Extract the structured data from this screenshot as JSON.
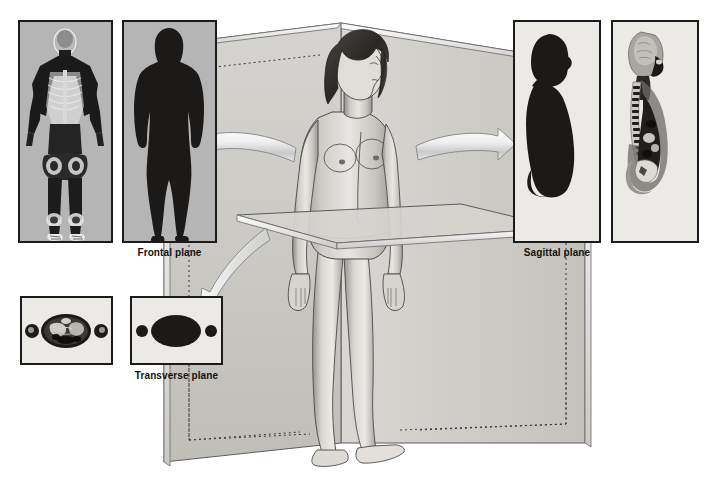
{
  "figure": {
    "background_color": "#ffffff",
    "panel_fill_left": "#b5b5b5",
    "panel_fill_right": "#eceae7",
    "panel_border_color": "#1b1b1b",
    "arrow_fill": "#e9e9e9",
    "arrow_stroke": "#8d8d8d",
    "plane_fill": "#cfcdc9",
    "plane_stroke": "#5a5a5a"
  },
  "labels": {
    "frontal": "Frontal plane",
    "sagittal": "Sagittal plane",
    "transverse": "Transverse plane"
  },
  "panels": [
    {
      "id": "frontal-radiograph",
      "name": "frontal-radiograph-panel",
      "group": "frontal",
      "image_kind": "full-body-coronal-radiograph",
      "x": 18,
      "y": 20,
      "w": 95,
      "h": 223,
      "fill": "#b5b5b5"
    },
    {
      "id": "frontal-silhouette",
      "name": "frontal-silhouette-panel",
      "group": "frontal",
      "image_kind": "full-body-coronal-silhouette",
      "x": 122,
      "y": 20,
      "w": 95,
      "h": 223,
      "fill": "#b5b5b5"
    },
    {
      "id": "transverse-section",
      "name": "transverse-section-panel",
      "group": "transverse",
      "image_kind": "abdominal-cross-section-ct",
      "x": 20,
      "y": 296,
      "w": 93,
      "h": 69,
      "fill": "#eceae7"
    },
    {
      "id": "transverse-silhouette",
      "name": "transverse-silhouette-panel",
      "group": "transverse",
      "image_kind": "abdominal-cross-section-silhouette",
      "x": 130,
      "y": 296,
      "w": 93,
      "h": 69,
      "fill": "#eceae7"
    },
    {
      "id": "sagittal-silhouette",
      "name": "sagittal-silhouette-panel",
      "group": "sagittal",
      "image_kind": "midsagittal-torso-silhouette",
      "x": 513,
      "y": 20,
      "w": 88,
      "h": 223,
      "fill": "#eceae7"
    },
    {
      "id": "sagittal-mri",
      "name": "sagittal-mri-panel",
      "group": "sagittal",
      "image_kind": "midsagittal-torso-mri",
      "x": 611,
      "y": 20,
      "w": 88,
      "h": 223,
      "fill": "#eceae7"
    }
  ],
  "label_positions": {
    "frontal": {
      "x": 122,
      "y": 247,
      "w": 95
    },
    "transverse": {
      "x": 130,
      "y": 370,
      "w": 93
    },
    "sagittal": {
      "x": 513,
      "y": 247,
      "w": 88
    }
  },
  "arrows": [
    {
      "name": "arrow-to-frontal",
      "direction": "left",
      "target": "frontal"
    },
    {
      "name": "arrow-to-sagittal",
      "direction": "right",
      "target": "sagittal"
    },
    {
      "name": "arrow-to-transverse",
      "direction": "down-left",
      "target": "transverse"
    }
  ],
  "central_figure": {
    "name": "standing-female-figure",
    "description": "Standing female figure in anatomical position intersected by three body planes",
    "planes": [
      {
        "name": "sagittal-plane-surface",
        "orientation": "vertical-midline"
      },
      {
        "name": "frontal-plane-surface",
        "orientation": "vertical-coronal"
      },
      {
        "name": "transverse-plane-surface",
        "orientation": "horizontal"
      }
    ]
  }
}
